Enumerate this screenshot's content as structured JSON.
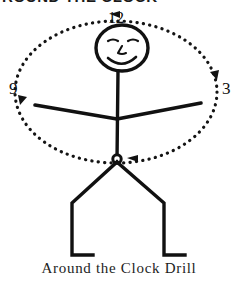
{
  "header": {
    "text": "ROUND THE CLOCK",
    "note": "cut off at top edge of image"
  },
  "caption": {
    "text": "Around the Clock Drill"
  },
  "colors": {
    "ink": "#111111",
    "background": "#ffffff",
    "dotted_path": "#141414"
  },
  "diagram": {
    "type": "stick-figure-clock-drill",
    "clock_numerals": [
      {
        "label": "12",
        "position": "top",
        "x": 108,
        "y": 10
      },
      {
        "label": "3",
        "position": "right",
        "x": 222,
        "y": 80
      },
      {
        "label": "9",
        "position": "left",
        "x": 9,
        "y": 80
      }
    ],
    "direction_arrows": [
      {
        "at": "12 o'clock",
        "points": "left"
      },
      {
        "at": "3 o'clock",
        "points": "down-left"
      },
      {
        "at": "6 o'clock",
        "points": "left"
      },
      {
        "at": "9 o'clock",
        "points": "down-right"
      }
    ],
    "dotted_ellipse": {
      "center_x": 116,
      "center_y": 92,
      "radius_x": 101,
      "radius_y": 71,
      "style": "dotted"
    },
    "figure": {
      "head": {
        "center_x": 122,
        "center_y": 48,
        "radius_x": 26,
        "radius_y": 23
      },
      "face": [
        "left-eye",
        "right-eye",
        "nose",
        "smile"
      ],
      "torso": {
        "top_y": 71,
        "bottom_y": 160,
        "x": 117
      },
      "arms": {
        "shoulder_y": 118,
        "left_hand_x": 35,
        "left_hand_y": 105,
        "right_hand_x": 200,
        "right_hand_y": 103
      },
      "hip": {
        "x": 117,
        "y": 160
      },
      "legs": {
        "left_foot_x": 72,
        "right_foot_x": 164,
        "foot_y": 255
      }
    }
  }
}
